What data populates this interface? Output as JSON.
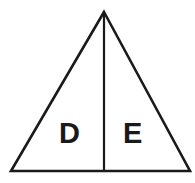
{
  "figure": {
    "type": "geometry-diagram",
    "shape": "triangle",
    "background_color": "#ffffff",
    "stroke_color": "#1a1a1a",
    "stroke_width": 2.6,
    "label_color": "#1a1a1a"
  },
  "geometry": {
    "apex": {
      "x": 104,
      "y": 12
    },
    "bottom_left": {
      "x": 11,
      "y": 171
    },
    "bottom_right": {
      "x": 190,
      "y": 171
    },
    "median_top": {
      "x": 104,
      "y": 12
    },
    "median_bottom": {
      "x": 104,
      "y": 171
    }
  },
  "regions": [
    {
      "id": "region-left",
      "label": "D",
      "position": "left",
      "label_x": 70,
      "label_y": 133
    },
    {
      "id": "region-right",
      "label": "E",
      "position": "right",
      "label_x": 131,
      "label_y": 133
    }
  ],
  "labels": {
    "left_region": "D",
    "right_region": "E"
  }
}
